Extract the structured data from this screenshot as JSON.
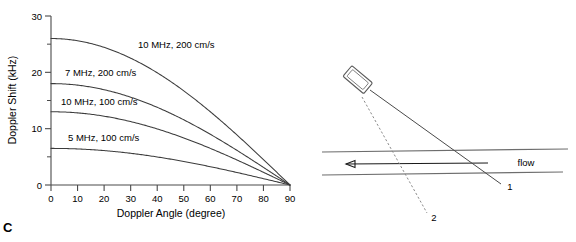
{
  "figure": {
    "panels": [
      {
        "letter": "C"
      },
      {
        "letter": "D"
      }
    ]
  },
  "chart_data": {
    "type": "line",
    "title": "",
    "xlabel": "Doppler Angle (degree)",
    "ylabel": "Doppler Shift (kHz)",
    "xlim": [
      0,
      90
    ],
    "ylim": [
      0,
      30
    ],
    "xticks": [
      0,
      10,
      20,
      30,
      40,
      50,
      60,
      70,
      80,
      90
    ],
    "xticklabels": [
      "0",
      "10",
      "20",
      "30",
      "40",
      "50",
      "60",
      "70",
      "80",
      "90"
    ],
    "yticks": [
      0,
      10,
      20,
      30
    ],
    "yticklabels": [
      "0",
      "10",
      "20",
      "30"
    ],
    "yminorticks": [
      5,
      15,
      25
    ],
    "grid": false,
    "legend_position": "inline-labels",
    "x": [
      0,
      10,
      20,
      30,
      40,
      50,
      60,
      70,
      80,
      90
    ],
    "series": [
      {
        "name": "10 MHz, 200 cm/s",
        "amplitude": 26.0,
        "values": [
          26.0,
          25.6,
          24.4,
          22.5,
          19.9,
          16.7,
          13.0,
          8.9,
          4.5,
          0.0
        ]
      },
      {
        "name": "7 MHz, 200 cm/s",
        "amplitude": 18.0,
        "values": [
          18.0,
          17.7,
          16.9,
          15.6,
          13.8,
          11.6,
          9.0,
          6.2,
          3.1,
          0.0
        ]
      },
      {
        "name": "10 MHz, 100 cm/s",
        "amplitude": 13.0,
        "values": [
          13.0,
          12.8,
          12.2,
          11.3,
          10.0,
          8.4,
          6.5,
          4.4,
          2.3,
          0.0
        ]
      },
      {
        "name": "5 MHz, 100 cm/s",
        "amplitude": 6.5,
        "values": [
          6.5,
          6.4,
          6.1,
          5.6,
          5.0,
          4.2,
          3.3,
          2.2,
          1.1,
          0.0
        ]
      }
    ],
    "annotations": [
      {
        "text": "10 MHz, 200 cm/s",
        "x_px": 138,
        "y_px": 48
      },
      {
        "text": "7 MHz, 200 cm/s",
        "x_px": 65,
        "y_px": 76
      },
      {
        "text": "10 MHz, 100 cm/s",
        "x_px": 61,
        "y_px": 105
      },
      {
        "text": "5 MHz, 100 cm/s",
        "x_px": 68,
        "y_px": 141
      }
    ]
  },
  "diagram": {
    "title": "",
    "flow_label": "flow",
    "beam_label_1": "1",
    "beam_label_2": "2",
    "probe_name": "ultrasound-transducer",
    "flow_direction": "leftward"
  }
}
